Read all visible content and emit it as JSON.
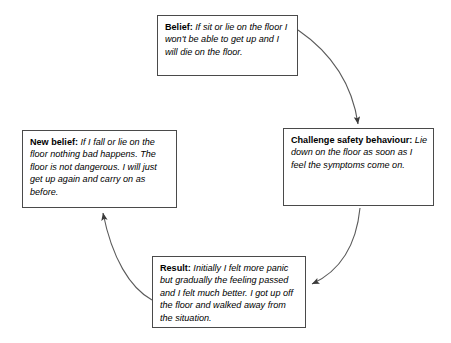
{
  "diagram": {
    "type": "cycle-flowchart",
    "line_color": "#4a4a4a",
    "background_color": "#ffffff",
    "text_color": "#000000",
    "nodes": [
      {
        "id": "belief",
        "lead": "Belief:",
        "body": " If sit or lie on the floor I won't be able to get up and I will die on the floor.",
        "position": "top"
      },
      {
        "id": "challenge",
        "lead": "Challenge safety behaviour:",
        "body": " Lie down on the floor as soon as I feel the symptoms come on.",
        "position": "right"
      },
      {
        "id": "result",
        "lead": "Result:",
        "body": " Initially I felt more panic but gradually the feeling passed and I felt much better. I got up off the floor and walked away from the situation.",
        "position": "bottom"
      },
      {
        "id": "newbelief",
        "lead": "New belief:",
        "body": " If I fall or lie on the floor nothing bad happens. The floor is not dangerous. I will just get up again and carry on as before.",
        "position": "left"
      }
    ],
    "edges": [
      {
        "id": "belief-to-challenge",
        "from": "belief",
        "to": "challenge",
        "label": ""
      },
      {
        "id": "challenge-to-result",
        "from": "challenge",
        "to": "result",
        "label": ""
      },
      {
        "id": "result-to-newbelief",
        "from": "result",
        "to": "newbelief",
        "label": ""
      }
    ]
  }
}
